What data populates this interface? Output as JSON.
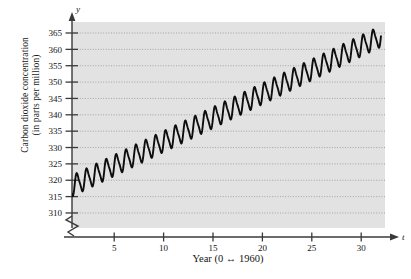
{
  "chart_data": {
    "type": "line",
    "title": "",
    "subtitle": "",
    "xlabel": "Year (0 ↔ 1960)",
    "ylabel": "Carbon dioxide concentration (in parts per million)",
    "ylabel_line1": "Carbon dioxide concentration",
    "ylabel_line2": "(in parts per million)",
    "x_axis_variable": "t",
    "y_axis_variable": "y",
    "xlim": [
      0,
      32
    ],
    "ylim": [
      308,
      368
    ],
    "y_axis_break": true,
    "grid": true,
    "grid_style": "dotted horizontal",
    "legend": "none",
    "xticks": [
      5,
      10,
      15,
      20,
      25,
      30
    ],
    "xtick_labels": [
      "5",
      "10",
      "15",
      "20",
      "25",
      "30"
    ],
    "yticks": [
      310,
      315,
      320,
      325,
      330,
      335,
      340,
      345,
      350,
      355,
      360,
      365
    ],
    "ytick_labels": [
      "310",
      "315",
      "320",
      "325",
      "330",
      "335",
      "340",
      "345",
      "350",
      "355",
      "360",
      "365"
    ],
    "series": [
      {
        "name": "Atmospheric CO2 concentration",
        "description": "annual oscillation superimposed on rising trend",
        "trend_start": 317.2,
        "trend_end": 364.0,
        "oscillation_amplitude": 3.0,
        "oscillation_period": 1.0,
        "x": [
          0,
          1,
          2,
          3,
          4,
          5,
          6,
          7,
          8,
          9,
          10,
          11,
          12,
          13,
          14,
          15,
          16,
          17,
          18,
          19,
          20,
          21,
          22,
          23,
          24,
          25,
          26,
          27,
          28,
          29,
          30,
          31,
          32
        ],
        "values": [
          317.2,
          317.8,
          318.4,
          319.1,
          319.8,
          320.5,
          321.2,
          322.0,
          322.8,
          323.6,
          324.4,
          325.3,
          326.2,
          327.1,
          328.0,
          329.0,
          330.0,
          331.0,
          332.1,
          333.2,
          334.3,
          335.5,
          336.7,
          337.9,
          339.2,
          340.5,
          341.8,
          343.2,
          344.6,
          346.0,
          347.5,
          349.0,
          350.5
        ]
      }
    ],
    "colors": {
      "plot_background": "#e2e2e2",
      "gridline": "#8c8c8c",
      "curve": "#0d0d0d",
      "axis": "#3a3a3a",
      "text": "#141414"
    }
  }
}
